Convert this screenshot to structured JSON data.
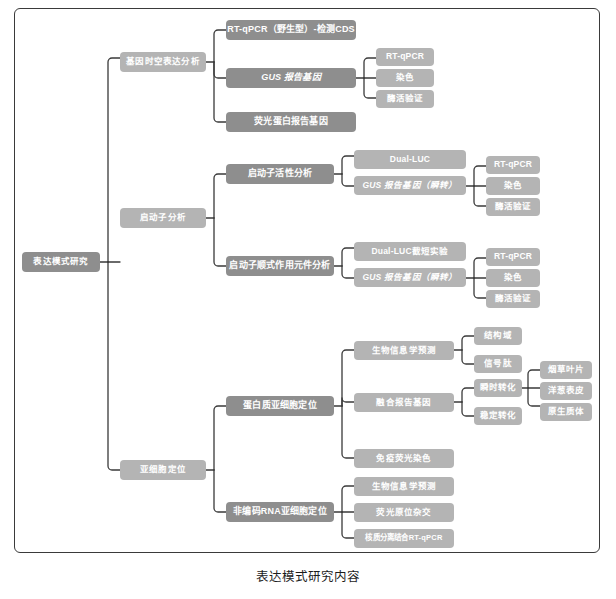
{
  "caption": "表达模式研究内容",
  "colors": {
    "frame_border": "#3a3a3a",
    "connector": "#3a3a3a",
    "node_dark": "#8e8e8e",
    "node_light": "#b4b4b4",
    "node_text": "#ffffff",
    "background": "#ffffff",
    "caption_text": "#1c1c1c"
  },
  "diagram": {
    "type": "tree-mindmap",
    "orientation": "left-to-right",
    "root": "表达模式研究",
    "nodes": {
      "root": "表达模式研究",
      "b1": "基因时空表达分析",
      "b1_c1": "RT-qPCR（野生型）-检测CDS",
      "b1_c2": "GUS 报告基因",
      "b1_c2_g1": "RT-qPCR",
      "b1_c2_g2": "染色",
      "b1_c2_g3": "酶活验证",
      "b1_c3": "荧光蛋白报告基因",
      "b2": "启动子分析",
      "b2_c1": "启动子活性分析",
      "b2_c1_g1": "Dual-LUC",
      "b2_c1_g2": "GUS 报告基因（瞬转）",
      "b2_c1_g2_h1": "RT-qPCR",
      "b2_c1_g2_h2": "染色",
      "b2_c1_g2_h3": "酶活验证",
      "b2_c2": "启动子顺式作用元件分析",
      "b2_c2_g1": "Dual-LUC截短实验",
      "b2_c2_g2": "GUS 报告基因（瞬转）",
      "b2_c2_g2_h1": "RT-qPCR",
      "b2_c2_g2_h2": "染色",
      "b2_c2_g2_h3": "酶活验证",
      "b3": "亚细胞定位",
      "b3_c1": "蛋白质亚细胞定位",
      "b3_c1_g1": "生物信息学预测",
      "b3_c1_g1_h1": "结构域",
      "b3_c1_g1_h2": "信号肽",
      "b3_c1_g2": "融合报告基因",
      "b3_c1_g2_h1": "瞬时转化",
      "b3_c1_g2_h1_i1": "烟草叶片",
      "b3_c1_g2_h1_i2": "洋葱表皮",
      "b3_c1_g2_h1_i3": "原生质体",
      "b3_c1_g2_h2": "稳定转化",
      "b3_c1_g3": "免疫荧光染色",
      "b3_c2": "非编码RNA亚细胞定位",
      "b3_c2_g1": "生物信息学预测",
      "b3_c2_g2": "荧光原位杂交",
      "b3_c2_g3": "核质分离结合RT-qPCR"
    }
  }
}
